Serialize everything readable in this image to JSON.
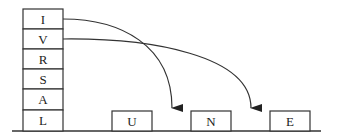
{
  "diagram": {
    "stack": {
      "cells": [
        "I",
        "V",
        "R",
        "S",
        "A",
        "L"
      ]
    },
    "slots": [
      {
        "label": "U"
      },
      {
        "label": "N"
      },
      {
        "label": "E"
      }
    ],
    "arrows": [
      {
        "from": "I",
        "to_gap": "between U and N"
      },
      {
        "from": "V",
        "to_gap": "between N and E"
      }
    ],
    "colors": {
      "stroke": "#333333",
      "background": "#ffffff"
    }
  }
}
